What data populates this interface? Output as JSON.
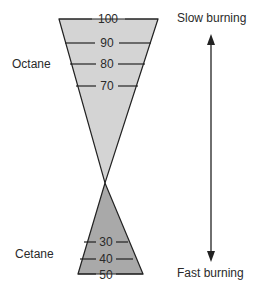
{
  "diagram": {
    "title": "",
    "upper_label": "Octane",
    "lower_label": "Cetane",
    "top_arrow_label": "Slow burning",
    "bottom_arrow_label": "Fast burning",
    "octane_ticks": [
      "100",
      "90",
      "80",
      "70"
    ],
    "cetane_ticks": [
      "30",
      "40",
      "50"
    ],
    "colors": {
      "octane_fill": "#d4d4d4",
      "cetane_fill": "#a9a9a9",
      "outline": "#222222",
      "text": "#2a2a2a"
    }
  }
}
